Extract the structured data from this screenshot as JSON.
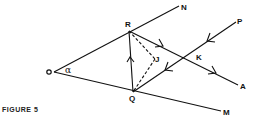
{
  "figure": {
    "caption": "FIGURE 5",
    "stroke_color": "#111111",
    "background": "#ffffff"
  },
  "points": {
    "O": {
      "label": "O"
    },
    "R": {
      "label": "R"
    },
    "Q": {
      "label": "Q"
    },
    "N": {
      "label": "N"
    },
    "M": {
      "label": "M"
    },
    "P": {
      "label": "P"
    },
    "K": {
      "label": "K"
    },
    "A": {
      "label": "A"
    },
    "J": {
      "label": "J"
    }
  },
  "angle": {
    "label": "α",
    "vertex": "O"
  },
  "segments": [
    {
      "from": "O",
      "to": "N",
      "style": "solid"
    },
    {
      "from": "O",
      "to": "M",
      "style": "solid"
    },
    {
      "from": "R",
      "to": "A",
      "style": "solid",
      "arrows": 2,
      "direction": "toward A"
    },
    {
      "from": "P",
      "to": "Q",
      "style": "solid",
      "arrows": 2,
      "direction": "toward Q"
    },
    {
      "from": "Q",
      "to": "R",
      "style": "solid",
      "arrows": 1,
      "direction": "toward R"
    },
    {
      "from": "R",
      "to": "J",
      "style": "dashed"
    },
    {
      "from": "J",
      "to": "Q",
      "style": "dashed"
    }
  ]
}
